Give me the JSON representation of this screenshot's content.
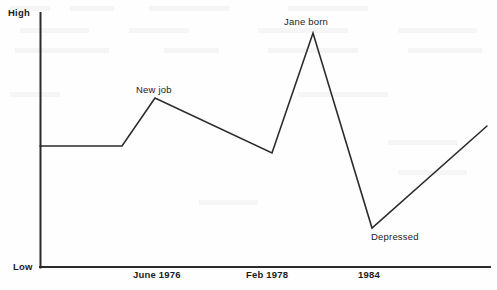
{
  "chart_data": {
    "type": "line",
    "title": "",
    "subtitle": "",
    "xlabel": "",
    "ylabel": "",
    "grid": false,
    "legend": "none",
    "y_axis": {
      "top_label": "High",
      "bottom_label": "Low",
      "ticks": [
        "Low",
        "High"
      ],
      "range": [
        0,
        100
      ]
    },
    "x_axis": {
      "tick_labels": [
        "June 1976",
        "Feb 1978",
        "1984"
      ],
      "tick_positions_px": [
        163,
        272,
        373
      ]
    },
    "series": [
      {
        "name": "mood",
        "color": "#2b2b2b",
        "points": [
          {
            "x_px": 40,
            "y_px": 146,
            "level": 49,
            "event": ""
          },
          {
            "x_px": 122,
            "y_px": 146,
            "level": 49,
            "event": ""
          },
          {
            "x_px": 155,
            "y_px": 98,
            "level": 68,
            "event": "New job"
          },
          {
            "x_px": 272,
            "y_px": 153,
            "level": 46,
            "event": ""
          },
          {
            "x_px": 313,
            "y_px": 33,
            "level": 93,
            "event": "Jane born"
          },
          {
            "x_px": 372,
            "y_px": 228,
            "level": 16,
            "event": "Depressed"
          },
          {
            "x_px": 487,
            "y_px": 126,
            "level": 57,
            "event": ""
          }
        ]
      }
    ],
    "annotations": [
      {
        "text": "New job",
        "x_px": 136,
        "y_px": 84
      },
      {
        "text": "Jane born",
        "x_px": 284,
        "y_px": 16
      },
      {
        "text": "Depressed",
        "x_px": 371,
        "y_px": 231
      }
    ]
  },
  "axes": {
    "high_label": "High",
    "low_label": "Low"
  },
  "xticks": {
    "tick1": "June 1976",
    "tick2": "Feb 1978",
    "tick3": "1984"
  },
  "annotations": {
    "new_job": "New job",
    "jane_born": "Jane born",
    "depressed": "Depressed"
  },
  "colors": {
    "line": "#2b2b2b",
    "axis": "#2b2b2b",
    "text": "#1b1b1b",
    "background": "#fefefe"
  }
}
